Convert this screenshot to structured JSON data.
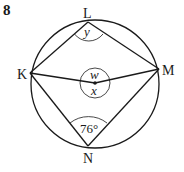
{
  "problem": {
    "number": "8"
  },
  "diagram": {
    "points": {
      "L": {
        "label": "L"
      },
      "K": {
        "label": "K"
      },
      "M": {
        "label": "M"
      },
      "N": {
        "label": "N"
      }
    },
    "angles": {
      "at_L": {
        "label": "y"
      },
      "center_top": {
        "label": "w"
      },
      "center_bottom": {
        "label": "x"
      },
      "at_N": {
        "label": "76°"
      }
    },
    "colors": {
      "stroke": "#1a1a1a",
      "background": "#ffffff"
    }
  }
}
